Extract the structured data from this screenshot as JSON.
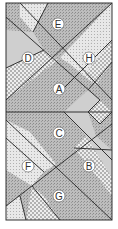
{
  "diagram": {
    "type": "patterned-region-puzzle",
    "colors": {
      "outline": "#333333",
      "dark_stipple": "#b4b4b4",
      "medium": "#c8c8c8",
      "light_dots": "#e6e6e6",
      "label_bg": "#ffffff"
    },
    "labels": [
      {
        "id": "E",
        "text": "E"
      },
      {
        "id": "D",
        "text": "D"
      },
      {
        "id": "H",
        "text": "H"
      },
      {
        "id": "A",
        "text": "A"
      },
      {
        "id": "C",
        "text": "C"
      },
      {
        "id": "F",
        "text": "F"
      },
      {
        "id": "B",
        "text": "B"
      },
      {
        "id": "G",
        "text": "G"
      }
    ]
  }
}
